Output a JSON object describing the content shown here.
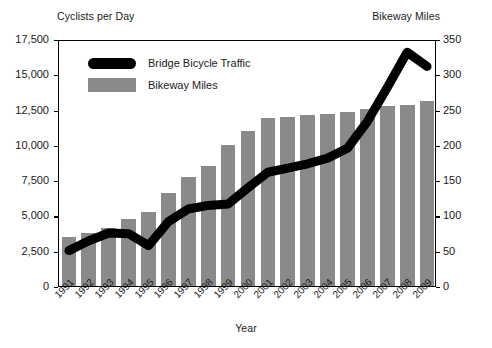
{
  "chart_data": {
    "type": "bar",
    "title": "",
    "xlabel": "Year",
    "ylabel": "Cyclists per Day",
    "y2label": "Bikeway Miles",
    "grid": false,
    "legend_position": "upper-left-inside",
    "categories": [
      "1991",
      "1992",
      "1993",
      "1994",
      "1995",
      "1996",
      "1997",
      "1998",
      "1999",
      "2000",
      "2001",
      "2002",
      "2003",
      "2004",
      "2005",
      "2006",
      "2007",
      "2008",
      "2009"
    ],
    "left_axis": {
      "label": "Cyclists per Day",
      "ticks": [
        "0",
        "2,500",
        "5,000",
        "7,500",
        "10,000",
        "12,500",
        "15,000",
        "17,500"
      ],
      "tick_values": [
        0,
        2500,
        5000,
        7500,
        10000,
        12500,
        15000,
        17500
      ],
      "ylim": [
        0,
        17500
      ]
    },
    "right_axis": {
      "label": "Bikeway Miles",
      "ticks": [
        "0",
        "50",
        "100",
        "150",
        "200",
        "250",
        "300",
        "350"
      ],
      "tick_values": [
        0,
        50,
        100,
        150,
        200,
        250,
        300,
        350
      ],
      "ylim": [
        0,
        350
      ]
    },
    "series": [
      {
        "name": "Bridge Bicycle Traffic",
        "type": "line",
        "axis": "left",
        "color": "#000000",
        "values": [
          2650,
          3350,
          3900,
          3850,
          3000,
          4700,
          5600,
          5850,
          5950,
          7100,
          8200,
          8500,
          8800,
          9200,
          9900,
          11800,
          14200,
          16700,
          15700
        ]
      },
      {
        "name": "Bikeway Miles",
        "type": "bar",
        "axis": "right",
        "color": "#8a8a8a",
        "values": [
          70,
          75,
          82,
          95,
          105,
          132,
          155,
          170,
          200,
          220,
          238,
          239,
          243,
          244,
          246,
          251,
          255,
          257,
          262
        ]
      }
    ]
  },
  "legend": {
    "items": [
      {
        "label": "Bridge Bicycle Traffic",
        "marker": "line-swatch"
      },
      {
        "label": "Bikeway Miles",
        "marker": "bar-swatch"
      }
    ]
  }
}
